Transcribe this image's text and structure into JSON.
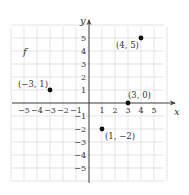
{
  "chart_data": {
    "type": "scatter",
    "title": "",
    "function_label": "f",
    "xlabel": "x",
    "ylabel": "y",
    "xlim": [
      -6,
      6
    ],
    "ylim": [
      -6,
      6
    ],
    "grid": true,
    "x_ticks": [
      -5,
      -4,
      -3,
      -2,
      -1,
      1,
      2,
      3,
      4,
      5
    ],
    "y_ticks": [
      -5,
      -4,
      -3,
      -2,
      -1,
      1,
      2,
      3,
      4,
      5
    ],
    "x_tick_labels": [
      "−5",
      "−4",
      "−3",
      "−2",
      "−1",
      "1",
      "2",
      "3",
      "4",
      "5"
    ],
    "y_tick_labels": [
      "−5",
      "−4",
      "−3",
      "−2",
      "−1",
      "1",
      "2",
      "3",
      "4",
      "5"
    ],
    "points": [
      {
        "x": -3,
        "y": 1,
        "label": "(−3, 1)"
      },
      {
        "x": 4,
        "y": 5,
        "label": "(4, 5)"
      },
      {
        "x": 3,
        "y": 0,
        "label": "(3, 0)"
      },
      {
        "x": 1,
        "y": -2,
        "label": "(1, −2)"
      }
    ]
  }
}
